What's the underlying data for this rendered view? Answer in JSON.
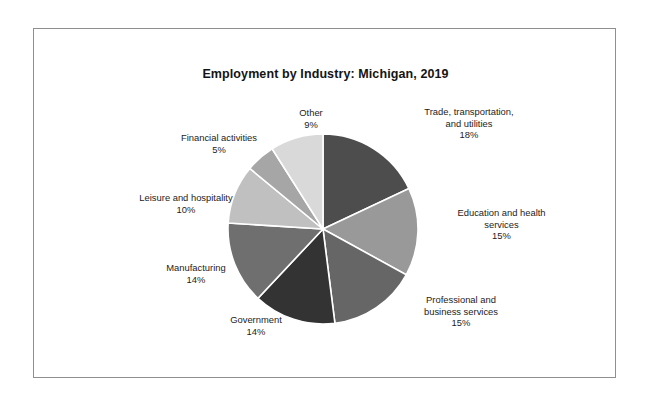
{
  "chart_data": {
    "type": "pie",
    "title": "Employment by Industry: Michigan, 2019",
    "xlabel": "",
    "ylabel": "",
    "legend": "none",
    "grid": false,
    "value_suffix": "%",
    "categories": [
      "Trade, transportation, and utilities",
      "Education and health services",
      "Professional and business services",
      "Government",
      "Manufacturing",
      "Leisure and hospitality",
      "Financial activities",
      "Other"
    ],
    "values": [
      18,
      15,
      15,
      14,
      14,
      10,
      5,
      9
    ],
    "colors": [
      "#4d4d4d",
      "#999999",
      "#666666",
      "#333333",
      "#6f6f6f",
      "#c0c0c0",
      "#a6a6a6",
      "#d9d9d9"
    ],
    "slices": [
      {
        "name": "Trade, transportation, and utilities",
        "label_line1": "Trade, transportation,",
        "label_line2": "and utilities",
        "percent": "18%",
        "value": 18,
        "color": "#4d4d4d"
      },
      {
        "name": "Education and health services",
        "label_line1": "Education and health",
        "label_line2": "services",
        "percent": "15%",
        "value": 15,
        "color": "#999999"
      },
      {
        "name": "Professional and business services",
        "label_line1": "Professional and",
        "label_line2": "business services",
        "percent": "15%",
        "value": 15,
        "color": "#666666"
      },
      {
        "name": "Government",
        "label_line1": "Government",
        "label_line2": "",
        "percent": "14%",
        "value": 14,
        "color": "#333333"
      },
      {
        "name": "Manufacturing",
        "label_line1": "Manufacturing",
        "label_line2": "",
        "percent": "14%",
        "value": 14,
        "color": "#6f6f6f"
      },
      {
        "name": "Leisure and hospitality",
        "label_line1": "Leisure and hospitality",
        "label_line2": "",
        "percent": "10%",
        "value": 10,
        "color": "#c0c0c0"
      },
      {
        "name": "Financial activities",
        "label_line1": "Financial activities",
        "label_line2": "",
        "percent": "5%",
        "value": 5,
        "color": "#a6a6a6"
      },
      {
        "name": "Other",
        "label_line1": "Other",
        "label_line2": "",
        "percent": "9%",
        "value": 9,
        "color": "#d9d9d9"
      }
    ]
  }
}
